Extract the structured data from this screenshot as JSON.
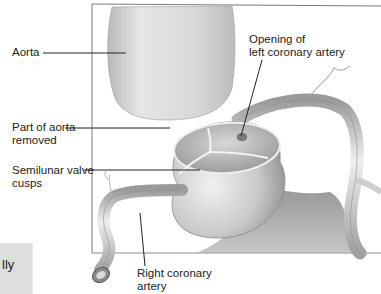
{
  "figure": {
    "labels": {
      "aorta": "Aorta",
      "part_removed_line1": "Part of aorta",
      "part_removed_line2": "removed",
      "semilunar_line1": "Semilunar valve",
      "semilunar_line2": "cusps",
      "left_opening_line1": "Opening of",
      "left_opening_line2": "left coronary artery",
      "right_coronary_line1": "Right coronary",
      "right_coronary_line2": "artery"
    }
  },
  "side_box": {
    "text_fragment": "lly",
    "color": "#dedede"
  },
  "colors": {
    "frame": "#7a7a7a",
    "leader": "#222222",
    "tissue_light": "#e6e6e6",
    "tissue_mid": "#bdbdbd",
    "tissue_dark": "#8a8a8a",
    "background": "#ffffff"
  }
}
